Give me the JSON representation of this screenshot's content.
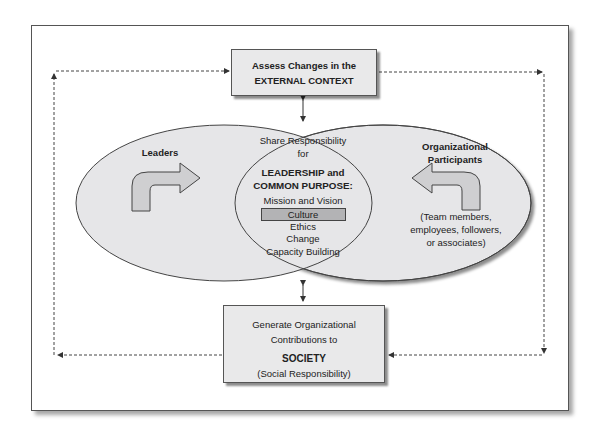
{
  "top_box": {
    "line1": "Assess Changes in the",
    "line2": "EXTERNAL CONTEXT"
  },
  "bottom_box": {
    "line1": "Generate Organizational",
    "line2": "Contributions to",
    "line3": "SOCIETY",
    "line4": "(Social Responsibility)"
  },
  "left_ellipse": {
    "label": "Leaders"
  },
  "right_ellipse": {
    "label_line1": "Organizational",
    "label_line2": "Participants",
    "desc_line1": "(Team members,",
    "desc_line2": "employees, followers,",
    "desc_line3": "or associates)"
  },
  "center": {
    "line1": "Share Responsibility",
    "line2": "for",
    "heading1": "LEADERSHIP and",
    "heading2": "COMMON PURPOSE:",
    "items": [
      "Mission and Vision",
      "Culture",
      "Ethics",
      "Change",
      "Capacity Building"
    ],
    "highlighted_item": "Culture"
  },
  "colors": {
    "ellipse_fill": "#e6e6e8",
    "box_fill": "#e9e9ea",
    "highlight_fill": "#b3b3b5",
    "arrow_fill": "#cfcfd1",
    "line": "#444444"
  }
}
